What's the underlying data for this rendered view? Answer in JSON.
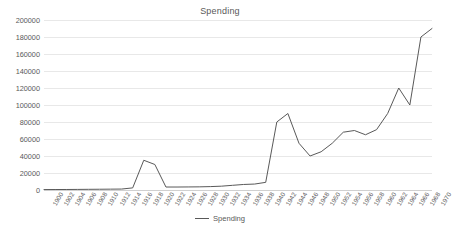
{
  "chart_data": {
    "type": "line",
    "title": "Spending",
    "xlabel": "",
    "ylabel": "",
    "ylim": [
      0,
      200000
    ],
    "ytick_step": 20000,
    "ytick_labels": [
      "0",
      "20000",
      "40000",
      "60000",
      "80000",
      "100000",
      "120000",
      "140000",
      "160000",
      "180000",
      "200000"
    ],
    "grid": true,
    "legend_position": "bottom",
    "line_color": "#595959",
    "categories": [
      "1900",
      "1902",
      "1904",
      "1906",
      "1908",
      "1910",
      "1912",
      "1914",
      "1916",
      "1918",
      "1920",
      "1922",
      "1924",
      "1926",
      "1928",
      "1930",
      "1932",
      "1934",
      "1936",
      "1938",
      "1940",
      "1942",
      "1944",
      "1946",
      "1948",
      "1950",
      "1952",
      "1954",
      "1956",
      "1958",
      "1960",
      "1962",
      "1964",
      "1966",
      "1968",
      "1970"
    ],
    "series": [
      {
        "name": "Spending",
        "values": [
          500,
          550,
          600,
          700,
          800,
          900,
          1000,
          1100,
          2500,
          35000,
          30000,
          3500,
          3500,
          3600,
          3700,
          4000,
          4500,
          5500,
          6500,
          7000,
          9000,
          80000,
          90000,
          55000,
          40000,
          45000,
          55000,
          68000,
          70000,
          65000,
          71000,
          90000,
          120000,
          100000,
          180000,
          190000
        ]
      }
    ]
  },
  "legend": {
    "entries": [
      {
        "label": "Spending",
        "marker": "line-marker"
      }
    ]
  }
}
